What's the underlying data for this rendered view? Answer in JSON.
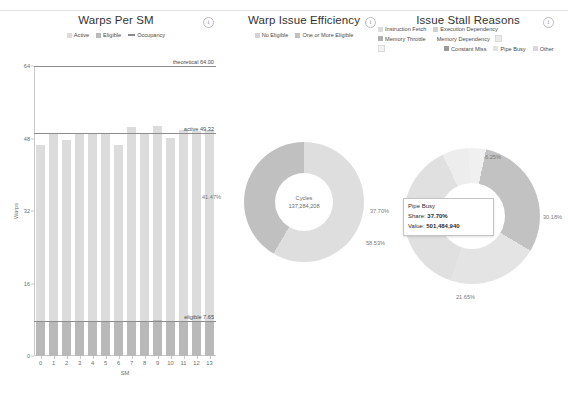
{
  "panels": [
    {
      "id": "warps-per-sm",
      "title": "Warps Per SM",
      "info_icon": "info-icon",
      "legend": [
        {
          "label": "Active",
          "type": "swatch",
          "color": "#dcdcdc"
        },
        {
          "label": "Eligible",
          "type": "swatch",
          "color": "#b9b9b9"
        },
        {
          "label": "Occupancy",
          "type": "line",
          "color": "#8a8a8a"
        }
      ]
    },
    {
      "id": "warp-issue-efficiency",
      "title": "Warp Issue Efficiency",
      "info_icon": "info-icon",
      "legend": [
        {
          "label": "No Eligible",
          "type": "swatch",
          "color": "#d2d2d2"
        },
        {
          "label": "One or More Eligible",
          "type": "swatch",
          "color": "#c0c0c0"
        }
      ]
    },
    {
      "id": "issue-stall-reasons",
      "title": "Issue Stall Reasons",
      "info_icon": "info-icon",
      "legend": [
        {
          "label": "Instruction Fetch",
          "type": "swatch",
          "color": "#dcdcdc"
        },
        {
          "label": "Execution Dependency",
          "type": "swatch",
          "color": "#cfcfcf"
        },
        {
          "label": "Memory Throttle",
          "type": "swatch",
          "color": "#b0b0b0"
        },
        {
          "label": "Memory Dependency",
          "type": "swatch",
          "color": "#eaeaea"
        },
        {
          "label": "",
          "type": "swatch",
          "color": "#f2f2f2"
        },
        {
          "label": "",
          "type": "swatch",
          "color": "#f2f2f2"
        },
        {
          "label": "Constant Miss",
          "type": "swatch",
          "color": "#9a9a9a"
        },
        {
          "label": "Pipe Busy",
          "type": "swatch",
          "color": "#e2e2e2"
        },
        {
          "label": "Other",
          "type": "swatch",
          "color": "#d8d8d8"
        }
      ]
    }
  ],
  "chart_data": [
    {
      "type": "bar",
      "id": "warps-per-sm",
      "title": "Warps Per SM",
      "xlabel": "SM",
      "ylabel": "Warps",
      "ylim": [
        0,
        64
      ],
      "yticks": [
        0,
        16,
        32,
        48,
        64
      ],
      "ytick_labels": [
        "0",
        "16",
        "32",
        "48",
        "64"
      ],
      "categories": [
        "0",
        "1",
        "2",
        "3",
        "4",
        "5",
        "6",
        "7",
        "8",
        "9",
        "10",
        "11",
        "12",
        "13"
      ],
      "stacked": true,
      "grid": false,
      "legend_position": "top",
      "series": [
        {
          "name": "Active",
          "color": "#dcdcdc",
          "values": [
            46.6,
            48.9,
            47.6,
            49.0,
            49.1,
            48.9,
            46.5,
            50.6,
            48.9,
            50.8,
            48.2,
            49.9,
            49.6,
            49.8
          ]
        },
        {
          "name": "Eligible",
          "color": "#b9b9b9",
          "values": [
            7.7,
            7.6,
            7.6,
            7.7,
            7.6,
            7.6,
            7.5,
            7.8,
            7.6,
            7.9,
            7.5,
            7.7,
            7.7,
            7.7
          ]
        }
      ],
      "reference_lines": [
        {
          "label": "theoretical 64.00",
          "value": 64.0,
          "color": "#8d8d8d"
        },
        {
          "label": "active 49.32",
          "value": 49.32,
          "color": "#8d8d8d"
        },
        {
          "label": "eligible 7.65",
          "value": 7.65,
          "color": "#8d8d8d"
        }
      ]
    },
    {
      "type": "pie",
      "id": "warp-issue-efficiency",
      "title": "Warp Issue Efficiency",
      "center_label": "Cycles",
      "center_value": "137,284,208",
      "legend_position": "top",
      "slices": [
        {
          "name": "No Eligible",
          "percent": 41.47,
          "label": "41.47%",
          "color": "#c0c0c0"
        },
        {
          "name": "One or More Eligible",
          "percent": 58.53,
          "label": "58.53%",
          "color": "#dedede"
        }
      ]
    },
    {
      "type": "pie",
      "id": "issue-stall-reasons",
      "title": "Issue Stall Reasons",
      "center_label": "Cycles",
      "center_value": "1,330,220,506",
      "legend_position": "top",
      "slices": [
        {
          "name": "Execution Dependency",
          "percent": 30.18,
          "label": "30.18%",
          "color": "#c2c2c2"
        },
        {
          "name": "Constant Miss",
          "percent": 21.65,
          "label": "21.65%",
          "color": "#e4e4e4"
        },
        {
          "name": "Pipe Busy",
          "percent": 37.7,
          "label": "37.70%",
          "color": "#e0e0e0"
        },
        {
          "name": "Instruction Fetch",
          "percent": 6.25,
          "label": "6.25%",
          "color": "#ededed"
        },
        {
          "name": "Other",
          "percent": 4.22,
          "label": "",
          "color": "#f0f0f0"
        }
      ]
    }
  ],
  "tooltip": {
    "name": "Pipe Busy",
    "share_label": "Share:",
    "share_value": "37.70%",
    "value_label": "Value:",
    "value_value": "501,484,940"
  }
}
